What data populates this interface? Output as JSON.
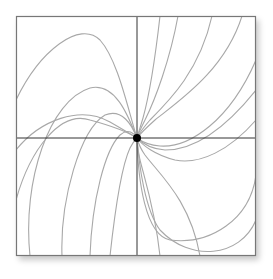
{
  "diagram": {
    "type": "phase-portrait",
    "colors": {
      "frame": "#777777",
      "axes": "#333333",
      "curves": "#a8a8a8",
      "equilibrium": "#000000"
    },
    "frame": {
      "x": 16,
      "y": 16,
      "w": 240,
      "h": 240
    },
    "center": {
      "x": 137,
      "y": 138,
      "r": 4
    },
    "curves": [
      "M16,100 C40,50 80,20 100,40 C118,60 128,110 137,138",
      "M30,256 C22,180 50,100 90,88 C115,82 128,115 137,138",
      "M62,256 C60,200 80,130 105,115 C122,108 132,125 137,138",
      "M90,256 C92,200 105,150 120,135 C128,128 134,133 137,138",
      "M110,256 C115,210 122,165 130,148 C133,142 135,140 137,138",
      "M16,200 C30,150 60,110 90,120 C112,126 128,132 137,138",
      "M16,150 C40,120 80,105 110,122 C124,130 132,135 137,138",
      "M242,16 C225,70 180,100 155,120 C146,128 140,134 137,138",
      "M212,16 C200,70 170,100 150,120 C143,128 139,134 137,138",
      "M178,16 C170,60 155,100 145,120 C141,128 138,134 137,138",
      "M160,16 C155,60 148,100 143,118 C140,128 138,134 137,138",
      "M256,175 C250,220 210,245 170,240 C145,235 138,180 137,138",
      "M256,220 C240,258 190,262 160,230 C145,210 139,165 137,138",
      "M256,120 C230,150 200,165 175,160 C155,155 142,145 137,138",
      "M256,90 C220,135 190,150 165,150 C150,149 141,142 137,138",
      "M256,60 C230,120 190,148 160,146 C148,145 141,141 137,138",
      "M200,256 C190,200 160,175 145,155 C140,148 138,142 137,138",
      "M160,256 C155,210 145,180 140,160 C138,150 137,144 137,138"
    ]
  }
}
